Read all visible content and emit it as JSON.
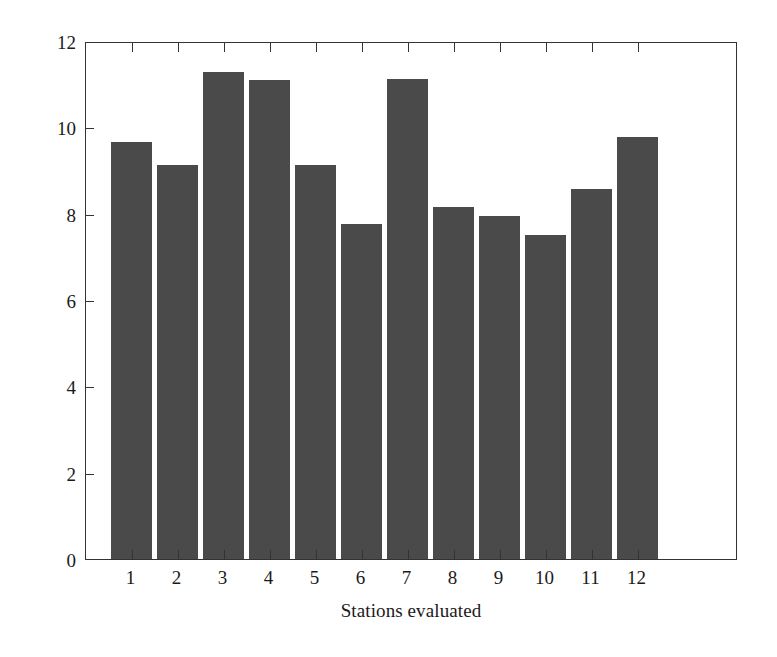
{
  "chart_data": {
    "type": "bar",
    "title": "",
    "xlabel": "Stations evaluated",
    "ylabel": "Percentage of collisions (%)",
    "categories": [
      "1",
      "2",
      "3",
      "4",
      "5",
      "6",
      "7",
      "8",
      "9",
      "10",
      "11",
      "12"
    ],
    "values": [
      9.65,
      9.12,
      11.28,
      11.1,
      9.12,
      7.75,
      11.12,
      8.15,
      7.95,
      7.5,
      8.58,
      9.78
    ],
    "ylim": [
      0,
      12
    ],
    "yticks": [
      0,
      2,
      4,
      6,
      8,
      10,
      12
    ],
    "ytick_labels": [
      "0",
      "2",
      "4",
      "6",
      "8",
      "10",
      "12"
    ],
    "grid": false,
    "legend": null,
    "bar_color": "#4a4a4a",
    "axis_color": "#333333",
    "background": "#ffffff"
  }
}
